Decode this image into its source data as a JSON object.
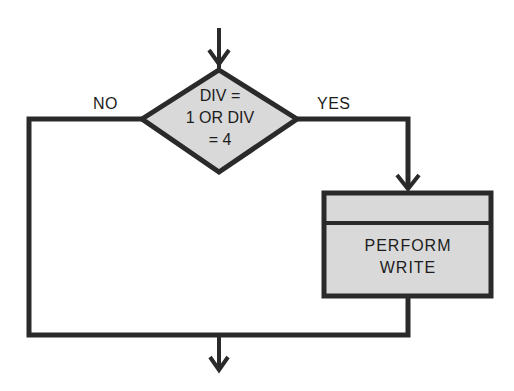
{
  "diagram": {
    "type": "flowchart",
    "style": {
      "line_color": "#2a2a2a",
      "fill_color": "#d9d9d9",
      "background": "#ffffff"
    },
    "decision": {
      "line1": "DIV =",
      "line2": "1 OR DIV",
      "line3": "= 4"
    },
    "branches": {
      "no_label": "NO",
      "yes_label": "YES"
    },
    "process": {
      "line1": "PERFORM",
      "line2": "WRITE"
    }
  }
}
